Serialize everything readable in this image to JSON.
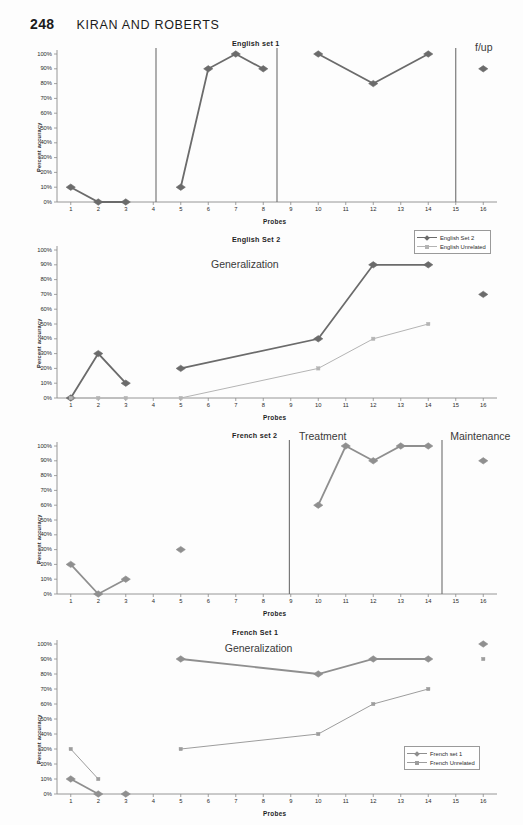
{
  "header": {
    "page_number": "248",
    "running_head": "KIRAN AND ROBERTS"
  },
  "axis": {
    "y_label": "Percent accuracy",
    "x_label": "Probes",
    "y_ticks": [
      "100%",
      "90%",
      "80%",
      "70%",
      "60%",
      "50%",
      "40%",
      "30%",
      "20%",
      "10%",
      "0%"
    ],
    "x_ticks": [
      "1",
      "2",
      "3",
      "4",
      "5",
      "6",
      "7",
      "8",
      "9",
      "10",
      "11",
      "12",
      "13",
      "14",
      "15",
      "16"
    ]
  },
  "colors": {
    "series_primary": "#6b6b6b",
    "series_secondary": "#b4b4b4",
    "axis": "#8a8a8a",
    "separator": "#6e6e6e",
    "text": "#2a2a2a"
  },
  "chart_data": [
    {
      "type": "line",
      "title": "English set 1",
      "xlabel": "Probes",
      "ylabel": "Percent accuracy",
      "ylim": [
        0,
        100
      ],
      "xlim": [
        0.5,
        16.5
      ],
      "grid": false,
      "legend": null,
      "annotations": [
        {
          "text": "f/up",
          "x": 15.7,
          "y": 104
        }
      ],
      "separators": [
        4.1,
        8.5,
        15.0
      ],
      "series": [
        {
          "name": "English set 1",
          "marker": "diamond",
          "color": "#6b6b6b",
          "segments": [
            {
              "x": [
                1,
                2,
                3
              ],
              "values": [
                10,
                0,
                0
              ]
            },
            {
              "x": [
                5,
                6,
                7,
                8
              ],
              "values": [
                10,
                90,
                100,
                90
              ]
            },
            {
              "x": [
                10,
                12,
                14
              ],
              "values": [
                100,
                80,
                100
              ]
            },
            {
              "x": [
                16
              ],
              "values": [
                90
              ]
            }
          ]
        }
      ]
    },
    {
      "type": "line",
      "title": "English Set 2",
      "xlabel": "Probes",
      "ylabel": "Percent accuracy",
      "ylim": [
        0,
        100
      ],
      "xlim": [
        0.5,
        16.5
      ],
      "grid": false,
      "legend": {
        "position": "top-right",
        "entries": [
          {
            "label": "English Set 2",
            "marker": "diamond",
            "color": "#6b6b6b"
          },
          {
            "label": "English Unrelated",
            "marker": "square",
            "color": "#b4b4b4"
          }
        ]
      },
      "annotations": [
        {
          "text": "Generalization",
          "x": 6.1,
          "y": 90
        }
      ],
      "separators": [],
      "series": [
        {
          "name": "English Set 2",
          "marker": "diamond",
          "color": "#6b6b6b",
          "segments": [
            {
              "x": [
                1,
                2,
                3
              ],
              "values": [
                0,
                30,
                10
              ]
            },
            {
              "x": [
                5,
                10,
                12,
                14
              ],
              "values": [
                20,
                40,
                90,
                90
              ]
            },
            {
              "x": [
                16
              ],
              "values": [
                70
              ]
            }
          ]
        },
        {
          "name": "English Unrelated",
          "marker": "square",
          "color": "#b4b4b4",
          "segments": [
            {
              "x": [
                1,
                2,
                3
              ],
              "values": [
                0,
                0,
                0
              ]
            },
            {
              "x": [
                5,
                10,
                12,
                14
              ],
              "values": [
                0,
                20,
                40,
                50
              ]
            }
          ]
        }
      ]
    },
    {
      "type": "line",
      "title": "French set 2",
      "xlabel": "Probes",
      "ylabel": "Percent accuracy",
      "ylim": [
        0,
        100
      ],
      "xlim": [
        0.5,
        16.5
      ],
      "grid": false,
      "legend": null,
      "annotations": [
        {
          "text": "Treatment",
          "x": 9.3,
          "y": 106
        },
        {
          "text": "Maintenance",
          "x": 14.8,
          "y": 106
        }
      ],
      "separators": [
        8.95,
        14.5
      ],
      "series": [
        {
          "name": "French set 2",
          "marker": "diamond",
          "color": "#8f8f8f",
          "segments": [
            {
              "x": [
                1,
                2,
                3
              ],
              "values": [
                20,
                0,
                10
              ]
            },
            {
              "x": [
                5
              ],
              "values": [
                30
              ]
            },
            {
              "x": [
                10,
                11,
                12,
                13,
                14
              ],
              "values": [
                60,
                100,
                90,
                100,
                100
              ]
            },
            {
              "x": [
                16
              ],
              "values": [
                90
              ]
            }
          ]
        }
      ]
    },
    {
      "type": "line",
      "title": "French Set 1",
      "xlabel": "Probes",
      "ylabel": "Percent accuracy",
      "ylim": [
        0,
        100
      ],
      "xlim": [
        0.5,
        16.5
      ],
      "grid": false,
      "legend": {
        "position": "bottom-right",
        "entries": [
          {
            "label": "French set 1",
            "marker": "diamond",
            "color": "#8f8f8f"
          },
          {
            "label": "French  Unrelated",
            "marker": "square",
            "color": "#9d9d9d"
          }
        ]
      },
      "annotations": [
        {
          "text": "Generalization",
          "x": 6.6,
          "y": 97
        }
      ],
      "separators": [],
      "series": [
        {
          "name": "French set 1",
          "marker": "diamond",
          "color": "#8f8f8f",
          "segments": [
            {
              "x": [
                1,
                2
              ],
              "values": [
                10,
                0
              ]
            },
            {
              "x": [
                3
              ],
              "values": [
                0
              ]
            },
            {
              "x": [
                5,
                10,
                12,
                14
              ],
              "values": [
                90,
                80,
                90,
                90
              ]
            },
            {
              "x": [
                16
              ],
              "values": [
                100
              ]
            }
          ]
        },
        {
          "name": "French  Unrelated",
          "marker": "square",
          "color": "#9d9d9d",
          "segments": [
            {
              "x": [
                1,
                2
              ],
              "values": [
                30,
                10
              ]
            },
            {
              "x": [
                5,
                10,
                12,
                14
              ],
              "values": [
                30,
                40,
                60,
                70
              ]
            },
            {
              "x": [
                16
              ],
              "values": [
                90
              ]
            }
          ]
        }
      ]
    }
  ]
}
